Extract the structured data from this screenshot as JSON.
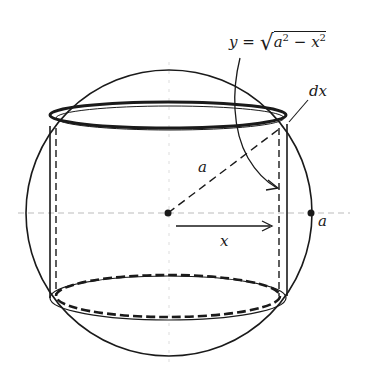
{
  "figure": {
    "colors": {
      "stroke": "#1a1a1a",
      "axis": "#bbbbbb",
      "background": "#ffffff"
    },
    "labels": {
      "formula_lhs": "y",
      "formula_eq": "=",
      "formula_root": "√",
      "formula_a": "a",
      "formula_a_exp": "2",
      "formula_minus": "−",
      "formula_x": "x",
      "formula_x_exp": "2",
      "dx": "dx",
      "radius": "a",
      "sphere_edge": "a",
      "x_arrow": "x"
    }
  }
}
